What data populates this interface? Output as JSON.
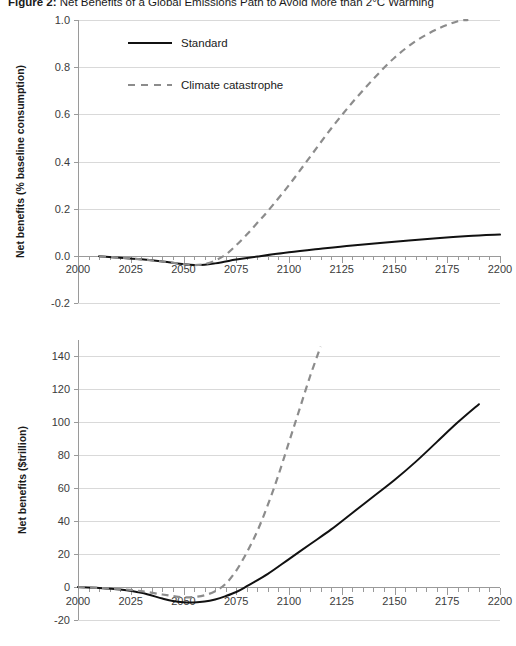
{
  "figure": {
    "label": "Figure 2:",
    "title": "Net Benefits of a Global Emissions Path to Avoid More than 2°C Warming"
  },
  "colors": {
    "standard_line": "#111111",
    "catastrophe_line": "#8c8c8c",
    "gridline": "#d9d9d9",
    "axis": "#9a9a9a",
    "text": "#1a1a1a",
    "tick_text": "#3b3b3b",
    "background": "#ffffff"
  },
  "legend": {
    "position": "inside-top-left",
    "entries": [
      {
        "label": "Standard",
        "style": "solid",
        "color": "#111111"
      },
      {
        "label": "Climate catastrophe",
        "style": "dashed",
        "color": "#8c8c8c"
      }
    ]
  },
  "chart_data": [
    {
      "id": "panel-top",
      "type": "line",
      "title": "",
      "xlabel": "",
      "ylabel": "Net benefits (% baseline consumption)",
      "xlim": [
        2000,
        2200
      ],
      "ylim": [
        -0.2,
        1.0
      ],
      "xticks": [
        2000,
        2025,
        2050,
        2075,
        2100,
        2125,
        2150,
        2175,
        2200
      ],
      "xtick_labels": [
        "2000",
        "2025",
        "2050",
        "2075",
        "2100",
        "2125",
        "2150",
        "2175",
        "2200"
      ],
      "x_minor_tick_interval": 5,
      "yticks": [
        -0.2,
        0.0,
        0.2,
        0.4,
        0.6,
        0.8,
        1.0
      ],
      "ytick_labels": [
        "-0.2",
        "0.0",
        "0.2",
        "0.4",
        "0.6",
        "0.8",
        "1.0"
      ],
      "grid": true,
      "legend": true,
      "legend_position": "upper left",
      "series": [
        {
          "name": "Standard",
          "style": "solid",
          "color": "#111111",
          "x": [
            2010,
            2020,
            2030,
            2040,
            2050,
            2055,
            2060,
            2065,
            2070,
            2075,
            2085,
            2100,
            2115,
            2130,
            2150,
            2170,
            2185,
            2200
          ],
          "values": [
            -0.002,
            -0.008,
            -0.015,
            -0.024,
            -0.035,
            -0.039,
            -0.038,
            -0.032,
            -0.024,
            -0.016,
            -0.003,
            0.015,
            0.03,
            0.044,
            0.06,
            0.075,
            0.084,
            0.09
          ]
        },
        {
          "name": "Climate catastrophe",
          "style": "dashed",
          "color": "#8c8c8c",
          "x": [
            2010,
            2020,
            2030,
            2040,
            2050,
            2055,
            2060,
            2065,
            2070,
            2075,
            2080,
            2085,
            2090,
            2100,
            2110,
            2120,
            2130,
            2140,
            2150,
            2160,
            2170,
            2180,
            2185
          ],
          "values": [
            -0.002,
            -0.008,
            -0.015,
            -0.024,
            -0.035,
            -0.039,
            -0.035,
            -0.02,
            0.005,
            0.045,
            0.09,
            0.14,
            0.19,
            0.3,
            0.42,
            0.54,
            0.65,
            0.75,
            0.84,
            0.91,
            0.96,
            0.995,
            1.0
          ]
        }
      ]
    },
    {
      "id": "panel-bottom",
      "type": "line",
      "title": "",
      "xlabel": "",
      "ylabel": "Net benefits ($trillion)",
      "xlim": [
        2000,
        2200
      ],
      "ylim": [
        -20,
        150
      ],
      "xticks": [
        2000,
        2025,
        2050,
        2075,
        2100,
        2125,
        2150,
        2175,
        2200
      ],
      "xtick_labels": [
        "2000",
        "2025",
        "2050",
        "2075",
        "2100",
        "2125",
        "2150",
        "2175",
        "2200"
      ],
      "x_minor_tick_interval": 5,
      "yticks": [
        -20,
        0,
        20,
        40,
        60,
        80,
        100,
        120,
        140
      ],
      "ytick_labels": [
        "-20",
        "0",
        "20",
        "40",
        "60",
        "80",
        "100",
        "120",
        "140"
      ],
      "grid": true,
      "legend": false,
      "series": [
        {
          "name": "Standard",
          "style": "solid",
          "color": "#111111",
          "x": [
            2000,
            2010,
            2020,
            2030,
            2040,
            2045,
            2050,
            2055,
            2060,
            2065,
            2070,
            2075,
            2080,
            2090,
            2100,
            2110,
            2120,
            2130,
            2140,
            2150,
            2160,
            2170,
            2180,
            2190
          ],
          "values": [
            0,
            -0.5,
            -1.5,
            -3.5,
            -7.0,
            -8.5,
            -9.2,
            -9.3,
            -8.8,
            -7.5,
            -5.5,
            -3.0,
            0.5,
            8.0,
            17.0,
            26.0,
            35.0,
            45.0,
            55.0,
            65.0,
            76.0,
            88.0,
            100.0,
            111.0
          ]
        },
        {
          "name": "Climate catastrophe",
          "style": "dashed",
          "color": "#8c8c8c",
          "x": [
            2000,
            2010,
            2020,
            2030,
            2040,
            2045,
            2050,
            2055,
            2060,
            2065,
            2070,
            2075,
            2080,
            2085,
            2090,
            2095,
            2100,
            2105,
            2110,
            2115
          ],
          "values": [
            0,
            -0.5,
            -1.2,
            -2.5,
            -4.5,
            -5.5,
            -6.2,
            -6.0,
            -5.0,
            -2.5,
            2.0,
            10.0,
            21.0,
            34.0,
            50.0,
            68.0,
            88.0,
            108.0,
            128.0,
            146.0
          ]
        }
      ]
    }
  ]
}
